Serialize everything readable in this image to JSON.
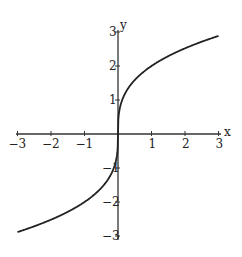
{
  "chart_data": {
    "type": "line",
    "title": "",
    "function": "y = 2*x^(1/3)",
    "xlabel": "x",
    "ylabel": "y",
    "xlim": [
      -3,
      3
    ],
    "ylim": [
      -3,
      3
    ],
    "grid": false,
    "legend": null,
    "x_ticks": [
      -3,
      -2,
      -1,
      1,
      2,
      3
    ],
    "y_ticks": [
      -3,
      -2,
      -1,
      1,
      2,
      3
    ],
    "x_tick_labels": [
      "−3",
      "−2",
      "−1",
      "1",
      "2",
      "3"
    ],
    "y_tick_labels": [
      "−3",
      "−2",
      "−1",
      "1",
      "2",
      "3"
    ],
    "series": [
      {
        "name": "curve",
        "color": "#222222",
        "x": [
          -3,
          -2.5,
          -2,
          -1.5,
          -1,
          -0.5,
          -0.25,
          -0.1,
          -0.02,
          0,
          0.02,
          0.1,
          0.25,
          0.5,
          1,
          1.5,
          2,
          2.5,
          3
        ],
        "y": [
          -2.88,
          -2.71,
          -2.52,
          -2.29,
          -2.0,
          -1.59,
          -1.26,
          -0.93,
          -0.54,
          0,
          0.54,
          0.93,
          1.26,
          1.59,
          2.0,
          2.29,
          2.52,
          2.71,
          2.88
        ]
      }
    ]
  },
  "axes": {
    "x_label": "x",
    "y_label": "y",
    "color": "#333333"
  }
}
